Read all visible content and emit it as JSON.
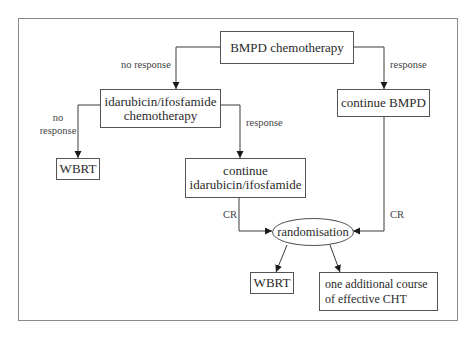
{
  "diagram": {
    "type": "flowchart",
    "nodes": {
      "bmpd": {
        "line1": "BMPD chemotherapy"
      },
      "idarubicin": {
        "line1": "idarubicin/ifosfamide",
        "line2": "chemotherapy"
      },
      "continue_bmpd": {
        "line1": "continue BMPD"
      },
      "wbrt_left": {
        "line1": "WBRT"
      },
      "continue_idarubicin": {
        "line1": "continue",
        "line2": "idarubicin/ifosfamide"
      },
      "randomisation": {
        "line1": "randomisation"
      },
      "wbrt_bottom": {
        "line1": "WBRT"
      },
      "additional_course": {
        "line1": "one additional course",
        "line2": "of effective CHT"
      }
    },
    "edges": [
      {
        "from": "bmpd",
        "to": "idarubicin",
        "label": "no response"
      },
      {
        "from": "bmpd",
        "to": "continue_bmpd",
        "label": "response"
      },
      {
        "from": "idarubicin",
        "to": "wbrt_left",
        "label_line1": "no",
        "label_line2": "response"
      },
      {
        "from": "idarubicin",
        "to": "continue_idarubicin",
        "label": "response"
      },
      {
        "from": "continue_idarubicin",
        "to": "randomisation",
        "label": "CR"
      },
      {
        "from": "continue_bmpd",
        "to": "randomisation",
        "label": "CR"
      },
      {
        "from": "randomisation",
        "to": "wbrt_bottom",
        "label": ""
      },
      {
        "from": "randomisation",
        "to": "additional_course",
        "label": ""
      }
    ],
    "colors": {
      "line": "#3a3a3a",
      "frame": "#8a8a8a",
      "text": "#2a2a2a"
    }
  }
}
